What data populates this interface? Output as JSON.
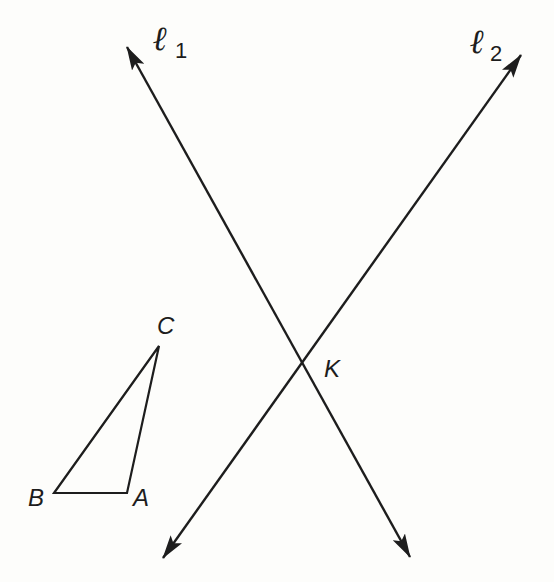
{
  "diagram": {
    "lines": [
      {
        "name": "l1",
        "symbol": "ℓ",
        "subscript": "1",
        "start": [
          127,
          47
        ],
        "end": [
          410,
          557
        ]
      },
      {
        "name": "l2",
        "symbol": "ℓ",
        "subscript": "2",
        "start": [
          521,
          55
        ],
        "end": [
          163,
          558
        ]
      }
    ],
    "intersection": {
      "label": "K",
      "point": [
        304,
        362
      ]
    },
    "triangle": {
      "vertices": {
        "A": {
          "label": "A",
          "point": [
            127,
            493
          ]
        },
        "B": {
          "label": "B",
          "point": [
            54,
            493
          ]
        },
        "C": {
          "label": "C",
          "point": [
            159,
            346
          ]
        }
      }
    },
    "colors": {
      "stroke": "#1d1d1d",
      "background": "#fdfdfb"
    }
  }
}
